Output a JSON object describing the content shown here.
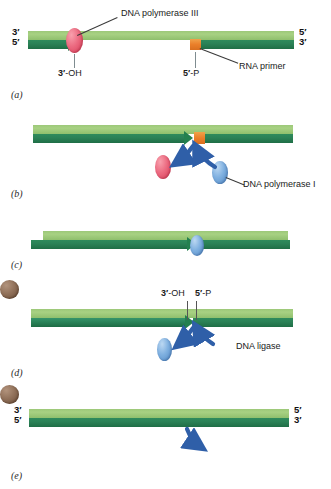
{
  "figure": {
    "width": 331,
    "height": 489,
    "background": "#ffffff"
  },
  "colors": {
    "template_strand": "#a8d183",
    "nascent_strand": "#2b8257",
    "rna_primer": "#ea7f2a",
    "dna_polymerase_iii": "#ec6b81",
    "dna_polymerase_i": "#7fb0e0",
    "dna_ligase": "#8e6e57",
    "arrow": "#2f5fa8",
    "leader_line": "#3a3a3a",
    "tick_line": "#7f8c90",
    "text": "#1a1a1a"
  },
  "panels": [
    {
      "id": "a",
      "letter": "(a)",
      "end_labels": {
        "left_top": "3′",
        "left_bottom": "5′",
        "right_top": "5′",
        "right_bottom": "3′"
      },
      "annotations": [
        {
          "name": "dna-polymerase-iii",
          "text": "DNA polymerase III"
        },
        {
          "name": "three-prime-oh",
          "text_bold": "3′",
          "text_rest": "-OH"
        },
        {
          "name": "five-prime-p",
          "text_bold": "5′",
          "text_rest": "-P"
        },
        {
          "name": "rna-primer",
          "text": "RNA primer"
        }
      ]
    },
    {
      "id": "b",
      "letter": "(b)",
      "annotations": [
        {
          "name": "dna-polymerase-i",
          "text": "DNA polymerase I"
        }
      ]
    },
    {
      "id": "c",
      "letter": "(c)",
      "annotations": []
    },
    {
      "id": "d",
      "letter": "(d)",
      "annotations": [
        {
          "name": "three-prime-oh",
          "text_bold": "3′",
          "text_rest": "-OH"
        },
        {
          "name": "five-prime-p",
          "text_bold": "5′",
          "text_rest": "-P"
        },
        {
          "name": "dna-ligase",
          "text": "DNA ligase"
        }
      ]
    },
    {
      "id": "e",
      "letter": "(e)",
      "end_labels": {
        "left_top": "3′",
        "left_bottom": "5′",
        "right_top": "5′",
        "right_bottom": "3′"
      },
      "annotations": []
    }
  ],
  "panel_a": {
    "letter": "(a)",
    "left_top_end": "3′",
    "left_bottom_end": "5′",
    "right_top_end": "5′",
    "right_bottom_end": "3′",
    "polymerase_label": "DNA polymerase III",
    "oh_bold": "3′",
    "oh_rest": "-OH",
    "p_bold": "5′",
    "p_rest": "-P",
    "primer_label": "RNA primer"
  },
  "panel_b": {
    "letter": "(b)",
    "polymerase_label": "DNA polymerase I"
  },
  "panel_c": {
    "letter": "(c)"
  },
  "panel_d": {
    "letter": "(d)",
    "oh_bold": "3′",
    "oh_rest": "-OH",
    "p_bold": "5′",
    "p_rest": "-P",
    "ligase_label": "DNA ligase"
  },
  "panel_e": {
    "letter": "(e)",
    "left_top_end": "3′",
    "left_bottom_end": "5′",
    "right_top_end": "5′",
    "right_bottom_end": "3′"
  }
}
